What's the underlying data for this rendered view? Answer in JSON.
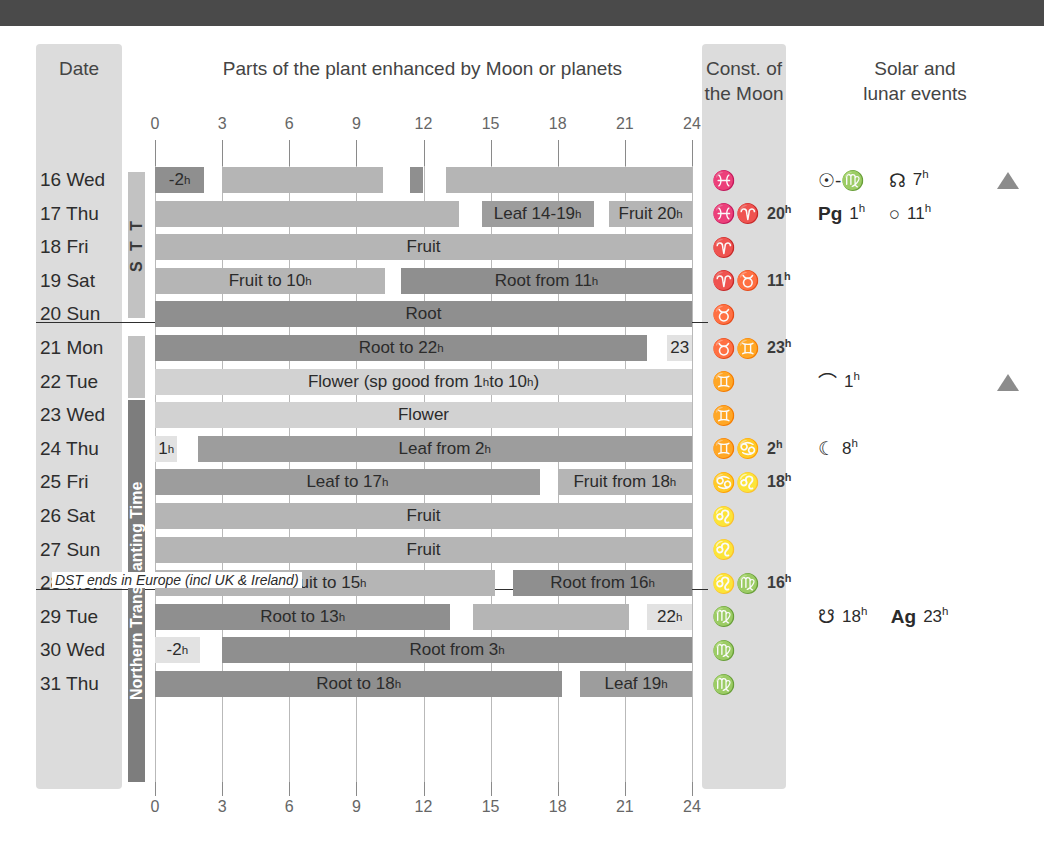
{
  "banner": {
    "color": "#4a4a4a"
  },
  "headers": {
    "date": "Date",
    "parts": "Parts of the plant enhanced by Moon or planets",
    "const_line1": "Const. of",
    "const_line2": "the Moon",
    "events_line1": "Solar and",
    "events_line2": "lunar events"
  },
  "axis": {
    "ticks": [
      "0",
      "3",
      "6",
      "9",
      "12",
      "15",
      "18",
      "21",
      "24"
    ],
    "min": 0,
    "max": 24
  },
  "period_labels": {
    "top": "S T T",
    "mid": "",
    "main": "Northern Transplanting Time"
  },
  "dst_note": "DST ends in Europe  (incl UK & Ireland)",
  "legend_colors": {
    "root": "#8f8f8f",
    "fruit": "#b5b5b5",
    "leaf": "#9d9d9d",
    "flower": "#d2d2d2",
    "pale": "#e2e2e2"
  },
  "rows": [
    {
      "date": "16 Wed",
      "bars": [
        {
          "start": 0,
          "end": 2.2,
          "type": "root",
          "label": "-2ʰ",
          "align": "center"
        },
        {
          "start": 3.0,
          "end": 10.2,
          "type": "fruit",
          "label": "",
          "align": "center"
        },
        {
          "start": 11.4,
          "end": 12.0,
          "type": "root",
          "label": "",
          "align": "center"
        },
        {
          "start": 13.0,
          "end": 24.0,
          "type": "fruit",
          "label": "",
          "align": "center"
        }
      ],
      "constellation": {
        "signs": "♓",
        "hour": ""
      },
      "events": [
        {
          "symbol": "☉-♍",
          "hour": "",
          "bold": false
        },
        {
          "symbol": "☊",
          "hour": "7ʰ",
          "bold": false
        }
      ],
      "triangle": true
    },
    {
      "date": "17 Thu",
      "bars": [
        {
          "start": 0,
          "end": 13.6,
          "type": "fruit",
          "label": "",
          "align": "center"
        },
        {
          "start": 14.6,
          "end": 19.6,
          "type": "leaf",
          "label": "Leaf 14-19ʰ",
          "align": "center"
        },
        {
          "start": 20.3,
          "end": 24.0,
          "type": "fruit",
          "label": "Fruit 20ʰ",
          "align": "center"
        }
      ],
      "constellation": {
        "signs": "♓♈",
        "hour": "20ʰ"
      },
      "events": [
        {
          "symbol": "Pg",
          "hour": "1ʰ",
          "bold": true
        },
        {
          "symbol": "○",
          "hour": "11ʰ",
          "bold": false
        }
      ],
      "triangle": false
    },
    {
      "date": "18 Fri",
      "bars": [
        {
          "start": 0,
          "end": 24.0,
          "type": "fruit",
          "label": "Fruit",
          "align": "center"
        }
      ],
      "constellation": {
        "signs": "♈",
        "hour": ""
      },
      "events": [],
      "triangle": false
    },
    {
      "date": "19 Sat",
      "bars": [
        {
          "start": 0,
          "end": 10.3,
          "type": "fruit",
          "label": "Fruit to 10ʰ",
          "align": "center"
        },
        {
          "start": 11.0,
          "end": 24.0,
          "type": "root",
          "label": "Root from 11ʰ",
          "align": "center"
        }
      ],
      "constellation": {
        "signs": "♈♉",
        "hour": "11ʰ"
      },
      "events": [],
      "triangle": false
    },
    {
      "date": "20 Sun",
      "bars": [
        {
          "start": 0,
          "end": 24.0,
          "type": "root",
          "label": "Root",
          "align": "center"
        }
      ],
      "constellation": {
        "signs": "♉",
        "hour": ""
      },
      "events": [],
      "triangle": false
    },
    {
      "date": "21 Mon",
      "bars": [
        {
          "start": 0,
          "end": 22.0,
          "type": "root",
          "label": "Root to 22ʰ",
          "align": "center"
        },
        {
          "start": 22.9,
          "end": 24.0,
          "type": "pale",
          "label": "23",
          "align": "center"
        }
      ],
      "constellation": {
        "signs": "♉♊",
        "hour": "23ʰ"
      },
      "events": [],
      "triangle": false
    },
    {
      "date": "22 Tue",
      "bars": [
        {
          "start": 0,
          "end": 24.0,
          "type": "flower",
          "label": "Flower (sp good from 1ʰ to 10ʰ)",
          "align": "center"
        }
      ],
      "constellation": {
        "signs": "♊",
        "hour": ""
      },
      "events": [
        {
          "symbol": "⌒",
          "hour": "1ʰ",
          "bold": false
        }
      ],
      "triangle": true
    },
    {
      "date": "23 Wed",
      "bars": [
        {
          "start": 0,
          "end": 24.0,
          "type": "flower",
          "label": "Flower",
          "align": "center"
        }
      ],
      "constellation": {
        "signs": "♊",
        "hour": ""
      },
      "events": [],
      "triangle": false
    },
    {
      "date": "24 Thu",
      "bars": [
        {
          "start": 0,
          "end": 1.0,
          "type": "pale",
          "label": "1ʰ",
          "align": "center"
        },
        {
          "start": 1.9,
          "end": 24.0,
          "type": "leaf",
          "label": "Leaf from 2ʰ",
          "align": "center"
        }
      ],
      "constellation": {
        "signs": "♊♋",
        "hour": "2ʰ"
      },
      "events": [
        {
          "symbol": "☾",
          "hour": "8ʰ",
          "bold": false
        }
      ],
      "triangle": false
    },
    {
      "date": "25 Fri",
      "bars": [
        {
          "start": 0,
          "end": 17.2,
          "type": "leaf",
          "label": "Leaf to 17ʰ",
          "align": "center"
        },
        {
          "start": 18.0,
          "end": 24.0,
          "type": "fruit",
          "label": "Fruit from 18ʰ",
          "align": "center"
        }
      ],
      "constellation": {
        "signs": "♋♌",
        "hour": "18ʰ"
      },
      "events": [],
      "triangle": false
    },
    {
      "date": "26 Sat",
      "bars": [
        {
          "start": 0,
          "end": 24.0,
          "type": "fruit",
          "label": "Fruit",
          "align": "center"
        }
      ],
      "constellation": {
        "signs": "♌",
        "hour": ""
      },
      "events": [],
      "triangle": false
    },
    {
      "date": "27 Sun",
      "bars": [
        {
          "start": 0,
          "end": 24.0,
          "type": "fruit",
          "label": "Fruit",
          "align": "center"
        }
      ],
      "constellation": {
        "signs": "♌",
        "hour": ""
      },
      "events": [],
      "triangle": false
    },
    {
      "date": "28 Mon",
      "bars": [
        {
          "start": 0,
          "end": 15.2,
          "type": "fruit",
          "label": "Fruit to 15ʰ",
          "align": "center"
        },
        {
          "start": 16.0,
          "end": 24.0,
          "type": "root",
          "label": "Root from 16ʰ",
          "align": "center"
        }
      ],
      "constellation": {
        "signs": "♌♍",
        "hour": "16ʰ"
      },
      "events": [],
      "triangle": false
    },
    {
      "date": "29 Tue",
      "bars": [
        {
          "start": 0,
          "end": 13.2,
          "type": "root",
          "label": "Root to 13ʰ",
          "align": "center"
        },
        {
          "start": 14.2,
          "end": 21.2,
          "type": "fruit",
          "label": "",
          "align": "center"
        },
        {
          "start": 22.0,
          "end": 24.0,
          "type": "pale",
          "label": "22ʰ",
          "align": "center"
        }
      ],
      "constellation": {
        "signs": "♍",
        "hour": ""
      },
      "events": [
        {
          "symbol": "☋",
          "hour": "18ʰ",
          "bold": false
        },
        {
          "symbol": "Ag",
          "hour": "23ʰ",
          "bold": true
        }
      ],
      "triangle": false
    },
    {
      "date": "30 Wed",
      "bars": [
        {
          "start": 0,
          "end": 2.0,
          "type": "pale",
          "label": "-2ʰ",
          "align": "center"
        },
        {
          "start": 3.0,
          "end": 24.0,
          "type": "root",
          "label": "Root from 3ʰ",
          "align": "center"
        }
      ],
      "constellation": {
        "signs": "♍",
        "hour": ""
      },
      "events": [],
      "triangle": false
    },
    {
      "date": "31 Thu",
      "bars": [
        {
          "start": 0,
          "end": 18.2,
          "type": "root",
          "label": "Root to 18ʰ",
          "align": "center"
        },
        {
          "start": 19.0,
          "end": 24.0,
          "type": "leaf",
          "label": "Leaf 19ʰ",
          "align": "center"
        }
      ],
      "constellation": {
        "signs": "♍",
        "hour": ""
      },
      "events": [],
      "triangle": false
    }
  ],
  "chart_data": {
    "type": "bar",
    "title": "Parts of the plant enhanced by Moon or planets",
    "xlabel": "Hour of day",
    "ylabel": "Date",
    "xlim": [
      0,
      24
    ],
    "grid": true,
    "categories": [
      "16 Wed",
      "17 Thu",
      "18 Fri",
      "19 Sat",
      "20 Sun",
      "21 Mon",
      "22 Tue",
      "23 Wed",
      "24 Thu",
      "25 Fri",
      "26 Sat",
      "27 Sun",
      "28 Mon",
      "29 Tue",
      "30 Wed",
      "31 Thu"
    ],
    "legend": [
      "Root",
      "Leaf",
      "Flower",
      "Fruit"
    ],
    "series": [
      {
        "name": "16 Wed",
        "segments": [
          [
            0,
            2.2,
            "Root"
          ],
          [
            3,
            10.2,
            "Fruit"
          ],
          [
            11.4,
            12,
            "Root"
          ],
          [
            13,
            24,
            "Fruit"
          ]
        ]
      },
      {
        "name": "17 Thu",
        "segments": [
          [
            0,
            13.6,
            "Fruit"
          ],
          [
            14.6,
            19.6,
            "Leaf"
          ],
          [
            20.3,
            24,
            "Fruit"
          ]
        ]
      },
      {
        "name": "18 Fri",
        "segments": [
          [
            0,
            24,
            "Fruit"
          ]
        ]
      },
      {
        "name": "19 Sat",
        "segments": [
          [
            0,
            10.3,
            "Fruit"
          ],
          [
            11,
            24,
            "Root"
          ]
        ]
      },
      {
        "name": "20 Sun",
        "segments": [
          [
            0,
            24,
            "Root"
          ]
        ]
      },
      {
        "name": "21 Mon",
        "segments": [
          [
            0,
            22,
            "Root"
          ],
          [
            22.9,
            24,
            "None"
          ]
        ]
      },
      {
        "name": "22 Tue",
        "segments": [
          [
            0,
            24,
            "Flower"
          ]
        ]
      },
      {
        "name": "23 Wed",
        "segments": [
          [
            0,
            24,
            "Flower"
          ]
        ]
      },
      {
        "name": "24 Thu",
        "segments": [
          [
            0,
            1,
            "None"
          ],
          [
            1.9,
            24,
            "Leaf"
          ]
        ]
      },
      {
        "name": "25 Fri",
        "segments": [
          [
            0,
            17.2,
            "Leaf"
          ],
          [
            18,
            24,
            "Fruit"
          ]
        ]
      },
      {
        "name": "26 Sat",
        "segments": [
          [
            0,
            24,
            "Fruit"
          ]
        ]
      },
      {
        "name": "27 Sun",
        "segments": [
          [
            0,
            24,
            "Fruit"
          ]
        ]
      },
      {
        "name": "28 Mon",
        "segments": [
          [
            0,
            15.2,
            "Fruit"
          ],
          [
            16,
            24,
            "Root"
          ]
        ]
      },
      {
        "name": "29 Tue",
        "segments": [
          [
            0,
            13.2,
            "Root"
          ],
          [
            14.2,
            21.2,
            "Fruit"
          ],
          [
            22,
            24,
            "None"
          ]
        ]
      },
      {
        "name": "30 Wed",
        "segments": [
          [
            0,
            2,
            "None"
          ],
          [
            3,
            24,
            "Root"
          ]
        ]
      },
      {
        "name": "31 Thu",
        "segments": [
          [
            0,
            18.2,
            "Root"
          ],
          [
            19,
            24,
            "Leaf"
          ]
        ]
      }
    ]
  }
}
